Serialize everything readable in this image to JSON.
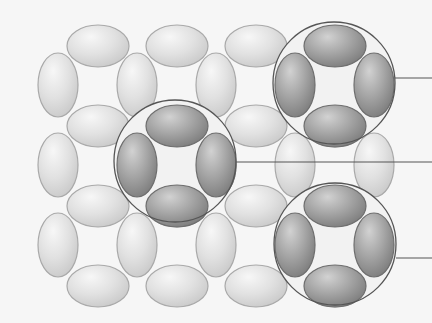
{
  "diagram": {
    "type": "ellipse-lattice-with-callouts",
    "background": "#f6f6f6",
    "colors": {
      "light_fill": "#e1e1e1",
      "light_highlight": "#f7f7f7",
      "light_shade": "#c9c9c9",
      "light_stroke": "#a9a9a9",
      "dark_fill": "#a3a3a3",
      "dark_highlight": "#d2d2d2",
      "dark_shade": "#7c7c7c",
      "dark_stroke": "#6e6e6e",
      "circle_stroke": "#555555",
      "leader_line": "#555555"
    },
    "horizontal_ellipse": {
      "rx": 31,
      "ry": 21
    },
    "vertical_ellipse": {
      "rx": 20,
      "ry": 32
    },
    "horizontal_ellipses": [
      {
        "cx": 98,
        "cy": 46
      },
      {
        "cx": 177,
        "cy": 46
      },
      {
        "cx": 256,
        "cy": 46
      },
      {
        "cx": 335,
        "cy": 46
      },
      {
        "cx": 98,
        "cy": 126
      },
      {
        "cx": 177,
        "cy": 126
      },
      {
        "cx": 256,
        "cy": 126
      },
      {
        "cx": 335,
        "cy": 126
      },
      {
        "cx": 98,
        "cy": 206
      },
      {
        "cx": 177,
        "cy": 206
      },
      {
        "cx": 256,
        "cy": 206
      },
      {
        "cx": 335,
        "cy": 206
      },
      {
        "cx": 98,
        "cy": 286
      },
      {
        "cx": 177,
        "cy": 286
      },
      {
        "cx": 256,
        "cy": 286
      },
      {
        "cx": 335,
        "cy": 286
      }
    ],
    "vertical_ellipses": [
      {
        "cx": 58,
        "cy": 85
      },
      {
        "cx": 137,
        "cy": 85
      },
      {
        "cx": 216,
        "cy": 85
      },
      {
        "cx": 295,
        "cy": 85
      },
      {
        "cx": 374,
        "cy": 85
      },
      {
        "cx": 58,
        "cy": 165
      },
      {
        "cx": 137,
        "cy": 165
      },
      {
        "cx": 216,
        "cy": 165
      },
      {
        "cx": 295,
        "cy": 165
      },
      {
        "cx": 374,
        "cy": 165
      },
      {
        "cx": 58,
        "cy": 245
      },
      {
        "cx": 137,
        "cy": 245
      },
      {
        "cx": 216,
        "cy": 245
      },
      {
        "cx": 295,
        "cy": 245
      },
      {
        "cx": 374,
        "cy": 245
      }
    ],
    "highlight_groups": [
      {
        "name": "top-right-group",
        "circle": {
          "cx": 334,
          "cy": 83,
          "r": 61
        },
        "leader": {
          "x1": 395,
          "y1": 78,
          "x2": 432,
          "y2": 78
        },
        "members": [
          {
            "orient": "h",
            "cx": 335,
            "cy": 46
          },
          {
            "orient": "h",
            "cx": 335,
            "cy": 126
          },
          {
            "orient": "v",
            "cx": 295,
            "cy": 85
          },
          {
            "orient": "v",
            "cx": 374,
            "cy": 85
          }
        ]
      },
      {
        "name": "center-group",
        "circle": {
          "cx": 175,
          "cy": 161,
          "r": 61
        },
        "leader": {
          "x1": 236,
          "y1": 162,
          "x2": 432,
          "y2": 162
        },
        "members": [
          {
            "orient": "h",
            "cx": 177,
            "cy": 126
          },
          {
            "orient": "h",
            "cx": 177,
            "cy": 206
          },
          {
            "orient": "v",
            "cx": 137,
            "cy": 165
          },
          {
            "orient": "v",
            "cx": 216,
            "cy": 165
          }
        ]
      },
      {
        "name": "bottom-right-group",
        "circle": {
          "cx": 335,
          "cy": 244,
          "r": 61
        },
        "leader": {
          "x1": 396,
          "y1": 258,
          "x2": 432,
          "y2": 258
        },
        "members": [
          {
            "orient": "h",
            "cx": 335,
            "cy": 206
          },
          {
            "orient": "h",
            "cx": 335,
            "cy": 286
          },
          {
            "orient": "v",
            "cx": 295,
            "cy": 245
          },
          {
            "orient": "v",
            "cx": 374,
            "cy": 245
          }
        ]
      }
    ]
  }
}
